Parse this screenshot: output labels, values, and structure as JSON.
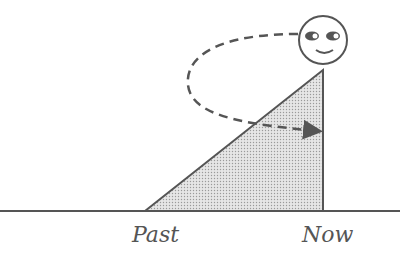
{
  "diagram": {
    "labels": {
      "past": "Past",
      "now": "Now"
    },
    "colors": {
      "stroke": "#555555",
      "fill": "#d4d4d4",
      "background": "#ffffff"
    },
    "elements": [
      "baseline",
      "shaded-triangle",
      "stick-figure-head",
      "dashed-curved-arrow"
    ]
  }
}
